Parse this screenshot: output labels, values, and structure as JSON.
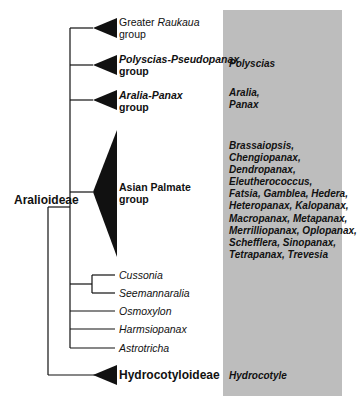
{
  "root_clades": {
    "aralioideae": "Aralioideae",
    "hydrocotyloideae": "Hydrocotyloideae"
  },
  "groups": [
    {
      "name_prefix": "Greater ",
      "name_italic": "Raukaua",
      "suffix": "group",
      "genera": ""
    },
    {
      "name_italic": "Polyscias-Pseudopanax",
      "suffix": "group",
      "genera": "Polyscias"
    },
    {
      "name_italic": "Aralia-Panax",
      "suffix": "group",
      "genera_lines": [
        "Aralia,",
        "Panax"
      ]
    },
    {
      "name": "Asian Palmate",
      "suffix": "group",
      "genera_lines": [
        "Brassaiopsis,",
        "Chengiopanax,",
        "Dendropanax,",
        "Eleutherococcus,",
        "Fatsia, Gamblea, Hedera,",
        "Heteropanax, Kalopanax,",
        "Macropanax, Metapanax,",
        "Merrilliopanax, Oplopanax,",
        "Schefflera, Sinopanax,",
        "Tetrapanax, Trevesia"
      ]
    }
  ],
  "single_taxa": [
    "Cussonia",
    "Seemannaralia",
    "Osmoxylon",
    "Harmsiopanax",
    "Astrotricha"
  ],
  "hydrocotyloideae_genera": "Hydrocotyle",
  "colors": {
    "highlight_box": "#bdbdbd",
    "lines": "#111111"
  }
}
